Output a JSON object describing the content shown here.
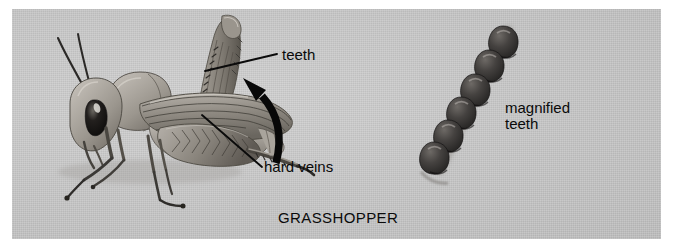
{
  "figure": {
    "background_color": "#ffffff",
    "panel_color": "#c9c9c9",
    "ink_color": "#0a0a0a"
  },
  "caption": {
    "text": "GRASSHOPPER"
  },
  "labels": {
    "teeth": "teeth",
    "hard_veins": "hard veins",
    "magnified_teeth": "magnified\nteeth"
  },
  "annotations": {
    "leader_teeth": "leader-line-teeth",
    "leader_hard_veins": "leader-line-hard-veins",
    "curved_arrow": "curved-arrow-pointing-to-teeth"
  },
  "illustration": {
    "grasshopper": "grasshopper-side-view-illustration",
    "magnified_teeth_row": {
      "name": "magnified-teeth-row",
      "count": 6,
      "tooth_color": "#3c3a38"
    }
  }
}
